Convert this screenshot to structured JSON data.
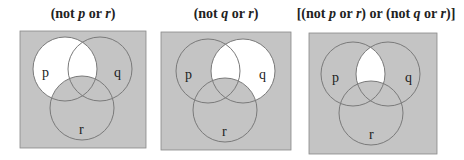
{
  "panels": [
    {
      "title_parts": [
        "(not ",
        "p",
        " or ",
        "r",
        ")"
      ],
      "labels": {
        "p": "p",
        "q": "q",
        "r": "r"
      },
      "shaded_description": "everything except p-only and p∩q-only (not p or r)"
    },
    {
      "title_parts": [
        "(not ",
        "q",
        " or ",
        "r",
        ")"
      ],
      "labels": {
        "p": "p",
        "q": "q",
        "r": "r"
      },
      "shaded_description": "everything except q-only and p∩q-only (not q or r)"
    },
    {
      "title_parts": [
        "[(not ",
        "p",
        " or ",
        "r",
        ") or (not ",
        "q",
        " or ",
        "r",
        ")]"
      ],
      "labels": {
        "p": "p",
        "q": "q",
        "r": "r"
      },
      "shaded_description": "everything except p∩q without r"
    }
  ],
  "colors": {
    "shade": "#c4c4c4",
    "unshaded": "#ffffff",
    "outline": "#7a7a7a"
  }
}
